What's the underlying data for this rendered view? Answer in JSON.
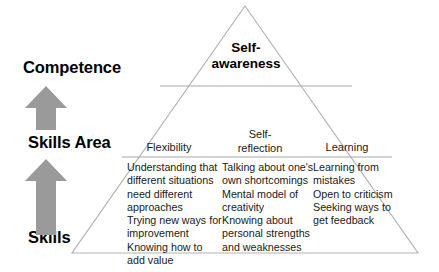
{
  "diagram": {
    "axis_labels": [
      {
        "id": "competence",
        "text": "Competence"
      },
      {
        "id": "skills-area",
        "text": "Skills Area"
      },
      {
        "id": "skills",
        "text": "Skills"
      }
    ],
    "arrows": [
      {
        "id": "arrow-upper",
        "direction": "up",
        "color": "#9a9a9a"
      },
      {
        "id": "arrow-lower",
        "direction": "up",
        "color": "#9a9a9a"
      }
    ],
    "apex": {
      "title": "Self-\nawareness"
    },
    "columns": [
      {
        "header": "Flexibility",
        "items": "Understanding that different situations need different approaches\nTrying new ways for improvement\nKnowing how to add value"
      },
      {
        "header": "Self-\nreflection",
        "items": "Talking about one's own shortcomings\nMental model of creativity\nKnowing about personal strengths and weaknesses"
      },
      {
        "header": "Learning",
        "items": "Learning from mistakes\nOpen to criticism\nSeeking ways to get feedback"
      }
    ],
    "colors": {
      "arrow_fill": "#9a9a9a",
      "pyramid_stroke": "#b4b4b4",
      "divider": "#a8a8a8",
      "text": "#1a1a1a",
      "background": "#ffffff"
    }
  }
}
